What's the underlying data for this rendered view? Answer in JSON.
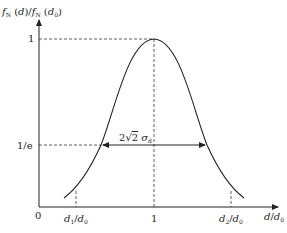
{
  "diagram": {
    "type": "gaussian-curve",
    "y_axis_label": {
      "f1": "f",
      "s1": "N",
      "m1": " (",
      "a1": "d",
      "c1": ")/",
      "f2": "f",
      "s2": "N",
      "m2": " (",
      "a2": "d",
      "s3": "0",
      "c2": ")"
    },
    "x_axis_label": {
      "a": "d",
      "slash": "/",
      "b": "d",
      "sub": "0"
    },
    "origin_label": "0",
    "y_ticks": {
      "one": "1",
      "one_over_e": "1/e"
    },
    "x_ticks": {
      "d1": {
        "a": "d",
        "asub": "1",
        "slash": "/",
        "b": "d",
        "bsub": "0"
      },
      "center": "1",
      "d2": {
        "a": "d",
        "asub": "2",
        "slash": "/",
        "b": "d",
        "bsub": "0"
      }
    },
    "width_annotation": {
      "pre": "2",
      "sqrt": "√",
      "radicand": "2",
      "sigma": "σ",
      "sub": "d"
    },
    "colors": {
      "curve": "#222222",
      "axes": "#222222",
      "dashed": "#333333"
    }
  }
}
